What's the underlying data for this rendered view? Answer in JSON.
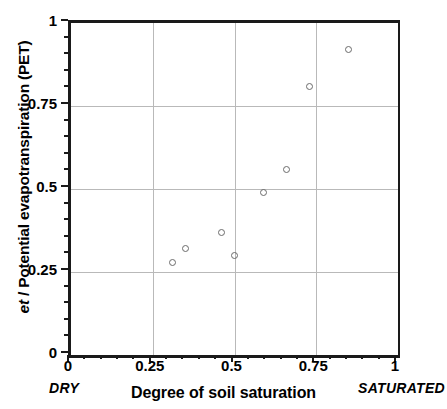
{
  "chart_data": {
    "type": "scatter",
    "title": "",
    "xlabel": "Degree of soil saturation",
    "ylabel": "et / Potential evapotranspiration (PET)",
    "ylabel_italic_part": "et",
    "ylabel_rest": " / Potential evapotranspiration (PET)",
    "xlim": [
      0,
      1
    ],
    "ylim": [
      0,
      1
    ],
    "xticks": [
      0,
      0.25,
      0.5,
      0.75,
      1
    ],
    "yticks": [
      0,
      0.25,
      0.5,
      0.75,
      1
    ],
    "xticklabels": [
      "0",
      "0.25",
      "0.5",
      "0.75",
      "1"
    ],
    "yticklabels": [
      "0",
      "0.25",
      "0.5",
      "0.75",
      "1"
    ],
    "grid": true,
    "grid_color": "#b9b9b9",
    "axis_color": "#1a1a1a",
    "marker": "open-circle",
    "marker_color": "#6b6b6b",
    "legend": "none",
    "x_axis_left_annotation": "DRY",
    "x_axis_right_annotation": "SATURATED",
    "x": [
      0.31,
      0.35,
      0.46,
      0.5,
      0.59,
      0.66,
      0.73,
      0.85
    ],
    "y": [
      0.28,
      0.32,
      0.37,
      0.3,
      0.49,
      0.56,
      0.81,
      0.92
    ],
    "points": [
      {
        "x": 0.31,
        "y": 0.28
      },
      {
        "x": 0.35,
        "y": 0.32
      },
      {
        "x": 0.46,
        "y": 0.37
      },
      {
        "x": 0.5,
        "y": 0.3
      },
      {
        "x": 0.59,
        "y": 0.49
      },
      {
        "x": 0.66,
        "y": 0.56
      },
      {
        "x": 0.73,
        "y": 0.81
      },
      {
        "x": 0.85,
        "y": 0.92
      }
    ],
    "minor_ticks_per_interval": 5
  }
}
